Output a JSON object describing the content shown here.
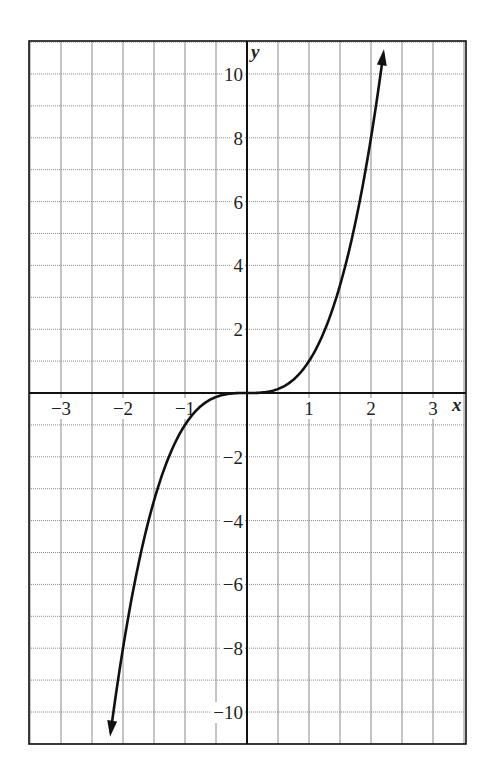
{
  "chart_data": {
    "type": "line",
    "title": "",
    "function": "y = x^3",
    "xlabel": "x",
    "ylabel": "y",
    "xlim": [
      -3.5,
      3.5
    ],
    "ylim": [
      -11,
      11
    ],
    "grid": true,
    "grid_spacing": {
      "x": 0.5,
      "y": 1
    },
    "x_ticks": [
      -3,
      -2,
      -1,
      1,
      2,
      3
    ],
    "x_tick_labels": [
      "−3",
      "−2",
      "−1",
      "1",
      "2",
      "3"
    ],
    "y_ticks": [
      -10,
      -8,
      -6,
      -4,
      -2,
      2,
      4,
      6,
      8,
      10
    ],
    "y_tick_labels": [
      "−10",
      "−8",
      "−6",
      "−4",
      "−2",
      "2",
      "4",
      "6",
      "8",
      "10"
    ],
    "series": [
      {
        "name": "y = x^3",
        "x": [
          -2.2,
          -2,
          -1.5,
          -1,
          -0.5,
          0,
          0.5,
          1,
          1.5,
          2,
          2.2
        ],
        "values": [
          -10.65,
          -8,
          -3.375,
          -1,
          -0.125,
          0,
          0.125,
          1,
          3.375,
          8,
          10.65
        ],
        "arrows": "both"
      }
    ]
  }
}
